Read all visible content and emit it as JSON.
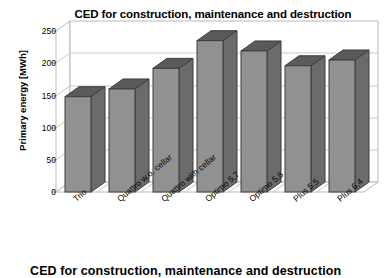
{
  "chart_data": {
    "type": "bar",
    "title": "CED for construction, maintenance and destruction",
    "xlabel": "",
    "ylabel": "Primary energy [MWh]",
    "ylim": [
      0,
      250
    ],
    "ytick_labels": [
      "250",
      "200",
      "150",
      "100",
      "50",
      "0"
    ],
    "ytick_values": [
      250,
      200,
      150,
      100,
      50,
      0
    ],
    "grid": true,
    "legend": "none",
    "style": "3d-column",
    "categories": [
      "Trio",
      "Quattro w.o. cellar",
      "Quattro with cellar",
      "Optimo 5,7",
      "Optimo 5,8",
      "Plus 5,5",
      "Plus 6,4"
    ],
    "values": [
      148,
      160,
      192,
      235,
      219,
      196,
      205
    ],
    "series": [
      {
        "name": "Primary energy",
        "values": [
          148,
          160,
          192,
          235,
          219,
          196,
          205
        ]
      }
    ]
  },
  "colors": {
    "bar_front": "#919191",
    "bar_side": "#6b6b6b",
    "bar_top": "#5a5a5a",
    "bar_outline": "#3d3d3d",
    "gridline": "#c9c9c9",
    "frame": "#b9b9b9",
    "background": "#ffffff",
    "text": "#000000"
  },
  "bottom_caption": "CED for construction, maintenance and destruction"
}
